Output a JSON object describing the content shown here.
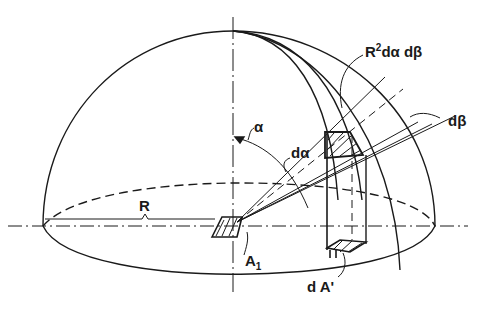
{
  "figure": {
    "colors": {
      "ink": "#1a1a1a",
      "background": "#ffffff"
    }
  },
  "labels": {
    "area_element": "R",
    "area_element_sup": "2",
    "area_element_rest": "dα dβ",
    "d_beta": "dβ",
    "alpha": "α",
    "d_alpha": "dα",
    "radius": "R",
    "a1": "A",
    "a1_sub": "1",
    "projected_area": "d A'"
  }
}
